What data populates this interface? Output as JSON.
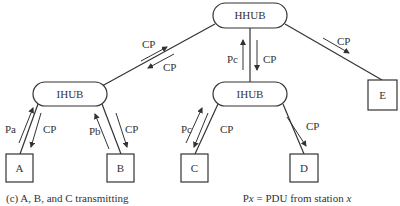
{
  "diagram": {
    "nodes": {
      "hhub": "HHUB",
      "ihub_left": "IHUB",
      "ihub_right": "IHUB",
      "a": "A",
      "b": "B",
      "c": "C",
      "d": "D",
      "e": "E"
    },
    "edge_labels": {
      "hhub_ihubl_up": "CP",
      "hhub_ihubl_down": "CP",
      "hhub_ihubr_up": "Pc",
      "hhub_ihubr_down": "CP",
      "hhub_e": "CP",
      "a_up": "Pa",
      "a_down": "CP",
      "b_up": "Pb",
      "b_down": "CP",
      "c_up": "Pc",
      "c_down": "CP",
      "d_down": "CP"
    },
    "caption_left": "(c) A, B, and C transmitting",
    "caption_right_prefix": "P",
    "caption_right_var": "x",
    "caption_right_mid": " = PDU from station ",
    "caption_right_var2": "x"
  }
}
